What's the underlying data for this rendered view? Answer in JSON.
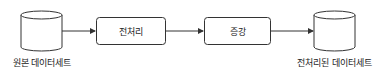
{
  "diagram": {
    "type": "flowchart",
    "direction": "left-to-right",
    "nodes": [
      {
        "id": "source",
        "shape": "cylinder",
        "label": "원본 데이터세트"
      },
      {
        "id": "preprocess",
        "shape": "rounded-rectangle",
        "label": "전처리"
      },
      {
        "id": "augment",
        "shape": "rounded-rectangle",
        "label": "증강"
      },
      {
        "id": "output",
        "shape": "cylinder",
        "label": "전처리된 데이터세트"
      }
    ],
    "edges": [
      {
        "from": "source",
        "to": "preprocess"
      },
      {
        "from": "preprocess",
        "to": "augment"
      },
      {
        "from": "augment",
        "to": "output"
      }
    ],
    "colors": {
      "stroke": "#333333",
      "fill": "#ffffff",
      "text": "#222222"
    }
  }
}
